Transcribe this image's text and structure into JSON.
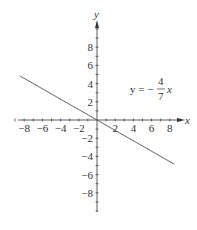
{
  "chart_data": {
    "type": "line",
    "title": "",
    "xlabel": "x",
    "ylabel": "y",
    "xlim": [
      -9,
      9
    ],
    "ylim": [
      -10,
      10
    ],
    "x_ticks": [
      "-8",
      "-6",
      "-4",
      "-2",
      "2",
      "4",
      "6",
      "8"
    ],
    "y_ticks": [
      "8",
      "6",
      "4",
      "2",
      "-2",
      "-4",
      "-6",
      "-8"
    ],
    "grid": false,
    "series": [
      {
        "name": "y = -4/7 x",
        "x": [
          -8.5,
          8.5
        ],
        "y": [
          4.86,
          -4.86
        ]
      }
    ],
    "annotations": [
      {
        "text": "y = −4/7 x",
        "x": 5.5,
        "y": 4
      }
    ]
  },
  "labels": {
    "x_axis": "x",
    "y_axis": "y",
    "eq_lhs": "y = −",
    "eq_num": "4",
    "eq_den": "7",
    "eq_var": "x"
  },
  "colors": {
    "axis": "#333333",
    "line": "#555555"
  }
}
